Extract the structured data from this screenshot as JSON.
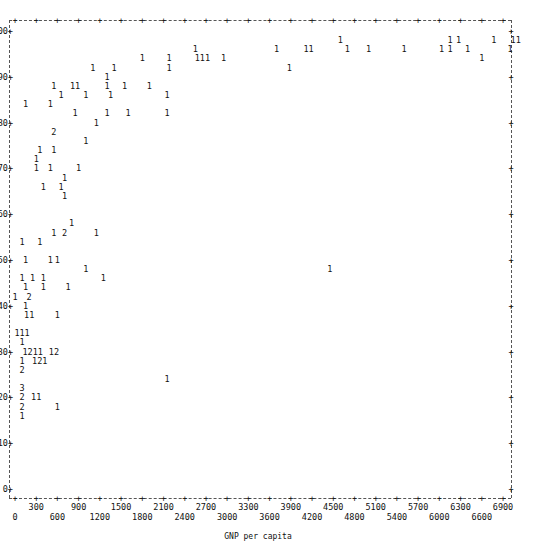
{
  "chart_data": {
    "type": "scatter",
    "style": "ascii-lineprinter",
    "title": "",
    "xlabel": "GNP per capita",
    "ylabel": "",
    "xlim": [
      0,
      7000
    ],
    "ylim": [
      0,
      100
    ],
    "x_ticks_row1": [
      "300",
      "900",
      "1500",
      "2100",
      "2700",
      "3300",
      "3900",
      "4500",
      "5100",
      "5700",
      "6300",
      "6900"
    ],
    "x_ticks_row2": [
      "0",
      "600",
      "1200",
      "1800",
      "2400",
      "3000",
      "3600",
      "4200",
      "4800",
      "5400",
      "6000",
      "6600"
    ],
    "y_ticks": [
      "100",
      "90",
      "80",
      "70",
      "60",
      "50",
      "40",
      "30",
      "20",
      "10",
      "0"
    ],
    "legend": "digits indicate number of observations at that position",
    "points": [
      {
        "x": 4600,
        "y": 98,
        "n": "1"
      },
      {
        "x": 6150,
        "y": 98,
        "n": "1"
      },
      {
        "x": 6270,
        "y": 98,
        "n": "1"
      },
      {
        "x": 6770,
        "y": 98,
        "n": "1"
      },
      {
        "x": 7080,
        "y": 98,
        "n": "11"
      },
      {
        "x": 2550,
        "y": 96,
        "n": "1"
      },
      {
        "x": 3700,
        "y": 96,
        "n": "1"
      },
      {
        "x": 4150,
        "y": 96,
        "n": "11"
      },
      {
        "x": 4700,
        "y": 96,
        "n": "1"
      },
      {
        "x": 5000,
        "y": 96,
        "n": "1"
      },
      {
        "x": 5500,
        "y": 96,
        "n": "1"
      },
      {
        "x": 6030,
        "y": 96,
        "n": "1"
      },
      {
        "x": 6150,
        "y": 96,
        "n": "1"
      },
      {
        "x": 6400,
        "y": 96,
        "n": "1"
      },
      {
        "x": 7000,
        "y": 96,
        "n": "1"
      },
      {
        "x": 1800,
        "y": 94,
        "n": "1"
      },
      {
        "x": 2180,
        "y": 94,
        "n": "1"
      },
      {
        "x": 2650,
        "y": 94,
        "n": "111"
      },
      {
        "x": 2950,
        "y": 94,
        "n": "1"
      },
      {
        "x": 6600,
        "y": 94,
        "n": "1"
      },
      {
        "x": 1100,
        "y": 92,
        "n": "1"
      },
      {
        "x": 1400,
        "y": 92,
        "n": "1"
      },
      {
        "x": 2180,
        "y": 92,
        "n": "1"
      },
      {
        "x": 3880,
        "y": 92,
        "n": "1"
      },
      {
        "x": 1300,
        "y": 90,
        "n": "1"
      },
      {
        "x": 550,
        "y": 88,
        "n": "1"
      },
      {
        "x": 850,
        "y": 88,
        "n": "11"
      },
      {
        "x": 1300,
        "y": 88,
        "n": "1"
      },
      {
        "x": 1550,
        "y": 88,
        "n": "1"
      },
      {
        "x": 1900,
        "y": 88,
        "n": "1"
      },
      {
        "x": 650,
        "y": 86,
        "n": "1"
      },
      {
        "x": 1000,
        "y": 86,
        "n": "1"
      },
      {
        "x": 1350,
        "y": 86,
        "n": "1"
      },
      {
        "x": 2150,
        "y": 86,
        "n": "1"
      },
      {
        "x": 150,
        "y": 84,
        "n": "1"
      },
      {
        "x": 500,
        "y": 84,
        "n": "1"
      },
      {
        "x": 850,
        "y": 82,
        "n": "1"
      },
      {
        "x": 1300,
        "y": 82,
        "n": "1"
      },
      {
        "x": 1600,
        "y": 82,
        "n": "1"
      },
      {
        "x": 2150,
        "y": 82,
        "n": "1"
      },
      {
        "x": 1150,
        "y": 80,
        "n": "1"
      },
      {
        "x": 550,
        "y": 78,
        "n": "2"
      },
      {
        "x": 1000,
        "y": 76,
        "n": "1"
      },
      {
        "x": 350,
        "y": 74,
        "n": "1"
      },
      {
        "x": 550,
        "y": 74,
        "n": "1"
      },
      {
        "x": 300,
        "y": 72,
        "n": "1"
      },
      {
        "x": 300,
        "y": 70,
        "n": "1"
      },
      {
        "x": 500,
        "y": 70,
        "n": "1"
      },
      {
        "x": 900,
        "y": 70,
        "n": "1"
      },
      {
        "x": 700,
        "y": 68,
        "n": "1"
      },
      {
        "x": 400,
        "y": 66,
        "n": "1"
      },
      {
        "x": 650,
        "y": 66,
        "n": "1"
      },
      {
        "x": 700,
        "y": 64,
        "n": "1"
      },
      {
        "x": 800,
        "y": 58,
        "n": "1"
      },
      {
        "x": 550,
        "y": 56,
        "n": "1"
      },
      {
        "x": 700,
        "y": 56,
        "n": "2"
      },
      {
        "x": 1150,
        "y": 56,
        "n": "1"
      },
      {
        "x": 100,
        "y": 54,
        "n": "1"
      },
      {
        "x": 350,
        "y": 54,
        "n": "1"
      },
      {
        "x": 150,
        "y": 50,
        "n": "1"
      },
      {
        "x": 500,
        "y": 50,
        "n": "1"
      },
      {
        "x": 600,
        "y": 50,
        "n": "1"
      },
      {
        "x": 1000,
        "y": 48,
        "n": "1"
      },
      {
        "x": 4450,
        "y": 48,
        "n": "1"
      },
      {
        "x": 100,
        "y": 46,
        "n": "1"
      },
      {
        "x": 250,
        "y": 46,
        "n": "1"
      },
      {
        "x": 400,
        "y": 46,
        "n": "1"
      },
      {
        "x": 1250,
        "y": 46,
        "n": "1"
      },
      {
        "x": 150,
        "y": 44,
        "n": "1"
      },
      {
        "x": 400,
        "y": 44,
        "n": "1"
      },
      {
        "x": 750,
        "y": 44,
        "n": "1"
      },
      {
        "x": 0,
        "y": 42,
        "n": "1"
      },
      {
        "x": 200,
        "y": 42,
        "n": "2"
      },
      {
        "x": 150,
        "y": 40,
        "n": "1"
      },
      {
        "x": 200,
        "y": 38,
        "n": "11"
      },
      {
        "x": 600,
        "y": 38,
        "n": "1"
      },
      {
        "x": 100,
        "y": 34,
        "n": "111"
      },
      {
        "x": 100,
        "y": 32,
        "n": "1"
      },
      {
        "x": 250,
        "y": 30,
        "n": "1211"
      },
      {
        "x": 550,
        "y": 30,
        "n": "12"
      },
      {
        "x": 100,
        "y": 28,
        "n": "1"
      },
      {
        "x": 350,
        "y": 28,
        "n": "121"
      },
      {
        "x": 100,
        "y": 26,
        "n": "2"
      },
      {
        "x": 2150,
        "y": 24,
        "n": "1"
      },
      {
        "x": 100,
        "y": 22,
        "n": "3"
      },
      {
        "x": 100,
        "y": 20,
        "n": "2"
      },
      {
        "x": 300,
        "y": 20,
        "n": "11"
      },
      {
        "x": 100,
        "y": 18,
        "n": "2"
      },
      {
        "x": 600,
        "y": 18,
        "n": "1"
      },
      {
        "x": 100,
        "y": 16,
        "n": "1"
      }
    ]
  }
}
